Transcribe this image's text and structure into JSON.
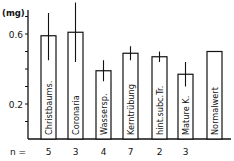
{
  "chart_data": {
    "type": "bar",
    "title": "",
    "xlabel": "",
    "ylabel": "(mg)",
    "ylim": [
      0,
      0.7
    ],
    "yticks": [
      0.1,
      0.2,
      0.3,
      0.4,
      0.5,
      0.6,
      0.7
    ],
    "ytick_labels": {
      "0.6": "0.6",
      "0.2": "0.2"
    },
    "grid": false,
    "categories": [
      "Christbaums.",
      "Coronaria",
      "Wassersp.",
      "Kerntrübung",
      "hint.subc.Tr.",
      "Mature K.",
      "Normalwert"
    ],
    "values": [
      0.59,
      0.61,
      0.39,
      0.49,
      0.47,
      0.37,
      0.5
    ],
    "error_upper": [
      0.72,
      0.78,
      0.45,
      0.53,
      0.5,
      0.44,
      null
    ],
    "error_lower": [
      0.45,
      0.44,
      0.33,
      0.45,
      0.44,
      0.3,
      null
    ],
    "n_label": "n =",
    "n_values": [
      "5",
      "3",
      "4",
      "7",
      "2",
      "3",
      ""
    ],
    "bar_color": "#ffffff",
    "edge_color": "#111111"
  }
}
